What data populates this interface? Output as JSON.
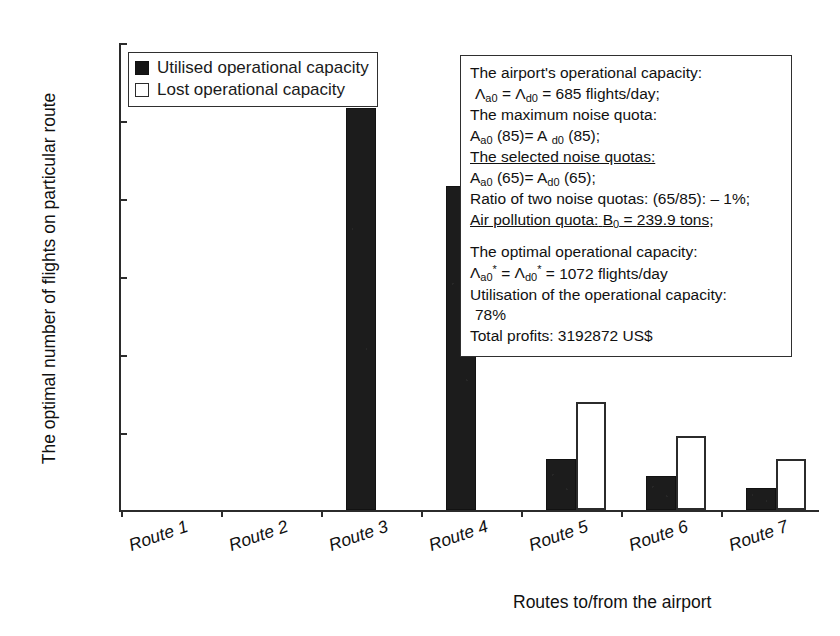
{
  "chart_data": {
    "type": "bar",
    "title": "",
    "xlabel": "Routes to/from the airport",
    "ylabel": "The optimal number of flights on particular route",
    "categories": [
      "Route 1",
      "Route 2",
      "Route 3",
      "Route 4",
      "Route 5",
      "Route 6",
      "Route 7"
    ],
    "ylim": [
      0,
      600
    ],
    "yticks": [
      0,
      100,
      200,
      300,
      400,
      500,
      600
    ],
    "grid": false,
    "legend_position": "top-left",
    "series": [
      {
        "name": "Utilised operational capacity",
        "color": "#151515",
        "values": [
          0,
          0,
          515,
          416,
          65,
          43,
          28
        ]
      },
      {
        "name": "Lost operational capacity",
        "color": "#ffffff",
        "values": [
          0,
          0,
          0,
          0,
          139,
          95,
          65
        ]
      }
    ]
  },
  "legend": {
    "items": [
      {
        "label": "Utilised operational capacity",
        "style": "filled"
      },
      {
        "label": "Lost operational capacity",
        "style": "hollow"
      }
    ]
  },
  "infobox": {
    "lines": [
      {
        "id": "l1",
        "text": "The airport's operational capacity:",
        "underline": false,
        "indent": false
      },
      {
        "id": "l2",
        "html": true,
        "underline": false,
        "indent": true
      },
      {
        "id": "l3",
        "text": "The maximum noise quota:",
        "underline": false,
        "indent": false
      },
      {
        "id": "l4",
        "html": true,
        "underline": false,
        "indent": false
      },
      {
        "id": "l5",
        "text": "The selected noise quotas:",
        "underline": true,
        "indent": false
      },
      {
        "id": "l6",
        "html": true,
        "underline": false,
        "indent": false
      },
      {
        "id": "l7",
        "text": "Ratio of two noise quotas: (65/85): – 1%;",
        "underline": false,
        "indent": false
      },
      {
        "id": "l8",
        "html": true,
        "underline": true,
        "indent": false
      },
      {
        "id": "l9",
        "text": "The optimal operational capacity:",
        "underline": false,
        "indent": false
      },
      {
        "id": "l10",
        "html": true,
        "underline": false,
        "indent": false
      },
      {
        "id": "l11",
        "text": "Utilisation of the operational capacity:",
        "underline": false,
        "indent": false
      },
      {
        "id": "l12",
        "text": "78%",
        "underline": false,
        "indent": true
      },
      {
        "id": "l13",
        "text": "Total profits: 3192872 US$",
        "underline": false,
        "indent": false
      }
    ],
    "values": {
      "operational_capacity_label": "The airport's operational capacity:",
      "operational_capacity_value": "685 flights/day;",
      "max_noise_quota_label": "The maximum noise quota:",
      "max_noise_quota_value": "(85)",
      "selected_noise_quotas_label": "The selected noise quotas:",
      "selected_noise_quotas_value": "(65)",
      "ratio_text": "Ratio of two noise quotas: (65/85): – 1%;",
      "air_pollution_label": "Air pollution quota:",
      "air_pollution_value": "239.9 tons;",
      "optimal_capacity_label": "The optimal operational capacity:",
      "optimal_capacity_value": "1072 flights/day",
      "utilisation_label": "Utilisation of the operational capacity:",
      "utilisation_value": "78%",
      "total_profits": "Total profits: 3192872 US$",
      "symbol_lambda_a": "Λa0",
      "symbol_lambda_d": "Λd0",
      "symbol_A_a": "Aa0",
      "symbol_A_d": "Ad0",
      "symbol_B": "B0"
    }
  }
}
